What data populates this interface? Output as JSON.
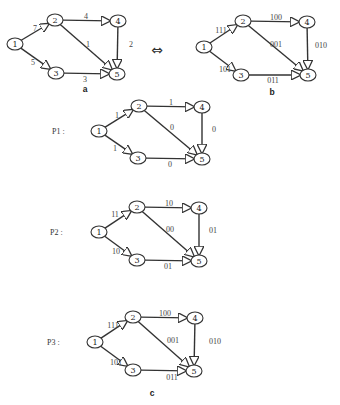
{
  "figure": {
    "equivalence_symbol": "⇔",
    "graphs": [
      {
        "id": "a",
        "caption": "a",
        "row_label": "",
        "caption_pos": [
          85,
          89
        ],
        "nodes": [
          {
            "id": "1",
            "label": "1",
            "x": 15,
            "y": 44
          },
          {
            "id": "2",
            "label": "2",
            "x": 55,
            "y": 20
          },
          {
            "id": "3",
            "label": "3",
            "x": 56,
            "y": 73
          },
          {
            "id": "4",
            "label": "4",
            "x": 118,
            "y": 21
          },
          {
            "id": "5",
            "label": "5",
            "x": 117,
            "y": 74
          }
        ],
        "edges": [
          {
            "from": "1",
            "to": "2",
            "weight": "7",
            "lx": 35,
            "ly": 28
          },
          {
            "from": "1",
            "to": "3",
            "weight": "5",
            "lx": 33,
            "ly": 62
          },
          {
            "from": "2",
            "to": "4",
            "weight": "4",
            "lx": 86,
            "ly": 16
          },
          {
            "from": "2",
            "to": "5",
            "weight": "1",
            "lx": 88,
            "ly": 44
          },
          {
            "from": "3",
            "to": "5",
            "weight": "3",
            "lx": 85,
            "ly": 79
          },
          {
            "from": "4",
            "to": "5",
            "weight": "2",
            "lx": 131,
            "ly": 44
          }
        ]
      },
      {
        "id": "b",
        "caption": "b",
        "row_label": "",
        "caption_pos": [
          272,
          92
        ],
        "nodes": [
          {
            "id": "1",
            "label": "1",
            "x": 204,
            "y": 47
          },
          {
            "id": "2",
            "label": "2",
            "x": 243,
            "y": 21
          },
          {
            "id": "3",
            "label": "3",
            "x": 241,
            "y": 75
          },
          {
            "id": "4",
            "label": "4",
            "x": 307,
            "y": 22
          },
          {
            "id": "5",
            "label": "5",
            "x": 308,
            "y": 75
          }
        ],
        "edges": [
          {
            "from": "1",
            "to": "2",
            "weight": "111",
            "lx": 221,
            "ly": 30
          },
          {
            "from": "1",
            "to": "3",
            "weight": "101",
            "lx": 225,
            "ly": 69
          },
          {
            "from": "2",
            "to": "4",
            "weight": "100",
            "lx": 276,
            "ly": 17
          },
          {
            "from": "2",
            "to": "5",
            "weight": "001",
            "lx": 276,
            "ly": 44
          },
          {
            "from": "3",
            "to": "5",
            "weight": "011",
            "lx": 273,
            "ly": 80
          },
          {
            "from": "4",
            "to": "5",
            "weight": "010",
            "lx": 321,
            "ly": 45
          }
        ]
      },
      {
        "id": "P1",
        "caption": "",
        "row_label": "P1 :",
        "label_pos": [
          52,
          131
        ],
        "nodes": [
          {
            "id": "1",
            "label": "1",
            "x": 99,
            "y": 131
          },
          {
            "id": "2",
            "label": "2",
            "x": 139,
            "y": 106
          },
          {
            "id": "3",
            "label": "3",
            "x": 138,
            "y": 158
          },
          {
            "id": "4",
            "label": "4",
            "x": 202,
            "y": 107
          },
          {
            "id": "5",
            "label": "5",
            "x": 202,
            "y": 159
          }
        ],
        "edges": [
          {
            "from": "1",
            "to": "2",
            "weight": "1",
            "lx": 117,
            "ly": 115
          },
          {
            "from": "1",
            "to": "3",
            "weight": "1",
            "lx": 115,
            "ly": 148
          },
          {
            "from": "2",
            "to": "4",
            "weight": "1",
            "lx": 171,
            "ly": 102
          },
          {
            "from": "2",
            "to": "5",
            "weight": "0",
            "lx": 172,
            "ly": 127
          },
          {
            "from": "3",
            "to": "5",
            "weight": "0",
            "lx": 170,
            "ly": 164
          },
          {
            "from": "4",
            "to": "5",
            "weight": "0",
            "lx": 214,
            "ly": 129
          }
        ]
      },
      {
        "id": "P2",
        "caption": "",
        "row_label": "P2 :",
        "label_pos": [
          50,
          232
        ],
        "nodes": [
          {
            "id": "1",
            "label": "1",
            "x": 99,
            "y": 232
          },
          {
            "id": "2",
            "label": "2",
            "x": 137,
            "y": 207
          },
          {
            "id": "3",
            "label": "3",
            "x": 137,
            "y": 260
          },
          {
            "id": "4",
            "label": "4",
            "x": 199,
            "y": 208
          },
          {
            "id": "5",
            "label": "5",
            "x": 199,
            "y": 261
          }
        ],
        "edges": [
          {
            "from": "1",
            "to": "2",
            "weight": "11",
            "lx": 115,
            "ly": 214
          },
          {
            "from": "1",
            "to": "3",
            "weight": "10",
            "lx": 116,
            "ly": 251
          },
          {
            "from": "2",
            "to": "4",
            "weight": "10",
            "lx": 169,
            "ly": 203
          },
          {
            "from": "2",
            "to": "5",
            "weight": "00",
            "lx": 170,
            "ly": 229
          },
          {
            "from": "3",
            "to": "5",
            "weight": "01",
            "lx": 168,
            "ly": 266
          },
          {
            "from": "4",
            "to": "5",
            "weight": "01",
            "lx": 213,
            "ly": 230
          }
        ]
      },
      {
        "id": "P3",
        "caption": "c",
        "row_label": "P3 :",
        "label_pos": [
          47,
          342
        ],
        "caption_pos": [
          152,
          393
        ],
        "nodes": [
          {
            "id": "1",
            "label": "1",
            "x": 95,
            "y": 342
          },
          {
            "id": "2",
            "label": "2",
            "x": 133,
            "y": 317
          },
          {
            "id": "3",
            "label": "3",
            "x": 133,
            "y": 370
          },
          {
            "id": "4",
            "label": "4",
            "x": 195,
            "y": 318
          },
          {
            "id": "5",
            "label": "5",
            "x": 194,
            "y": 371
          }
        ],
        "edges": [
          {
            "from": "1",
            "to": "2",
            "weight": "111",
            "lx": 113,
            "ly": 325
          },
          {
            "from": "1",
            "to": "3",
            "weight": "101",
            "lx": 116,
            "ly": 362
          },
          {
            "from": "2",
            "to": "4",
            "weight": "100",
            "lx": 165,
            "ly": 313
          },
          {
            "from": "2",
            "to": "5",
            "weight": "001",
            "lx": 173,
            "ly": 340
          },
          {
            "from": "3",
            "to": "5",
            "weight": "011",
            "lx": 172,
            "ly": 377
          },
          {
            "from": "4",
            "to": "5",
            "weight": "010",
            "lx": 215,
            "ly": 341
          }
        ]
      }
    ],
    "equivalence_pos": [
      157,
      50
    ]
  }
}
